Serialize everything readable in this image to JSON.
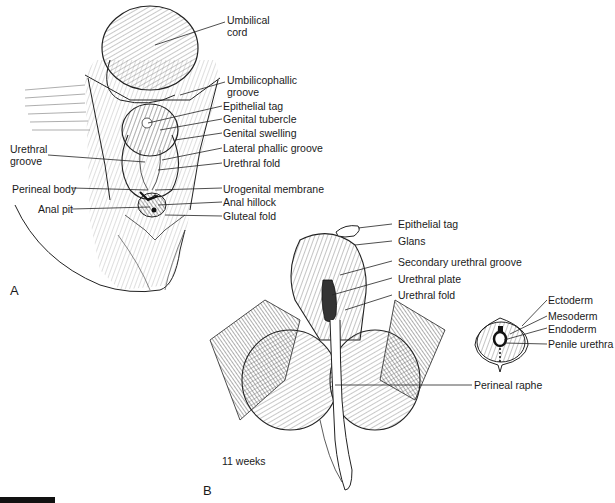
{
  "figure": {
    "panel_a": {
      "letter": "A",
      "labels_right": [
        {
          "text": "Umbilical",
          "text2": "cord"
        },
        {
          "text": "Umbilicophallic",
          "text2": "groove"
        },
        {
          "text": "Epithelial tag"
        },
        {
          "text": "Genital tubercle"
        },
        {
          "text": "Genital swelling"
        },
        {
          "text": "Lateral phallic groove"
        },
        {
          "text": "Urethral fold"
        },
        {
          "text": "Urogenital membrane"
        },
        {
          "text": "Anal hillock"
        },
        {
          "text": "Gluteal fold"
        }
      ],
      "labels_left": [
        {
          "text": "Urethral",
          "text2": "groove"
        },
        {
          "text": "Perineal body"
        },
        {
          "text": "Anal pit"
        }
      ]
    },
    "panel_b": {
      "letter": "B",
      "age": "11 weeks",
      "labels": [
        {
          "text": "Epithelial tag"
        },
        {
          "text": "Glans"
        },
        {
          "text": "Secondary urethral groove"
        },
        {
          "text": "Urethral plate"
        },
        {
          "text": "Urethral fold"
        },
        {
          "text": "Perineal raphe"
        }
      ]
    },
    "cross_section": {
      "labels": [
        {
          "text": "Ectoderm"
        },
        {
          "text": "Mesoderm"
        },
        {
          "text": "Endoderm"
        },
        {
          "text": "Penile urethra"
        }
      ]
    }
  }
}
